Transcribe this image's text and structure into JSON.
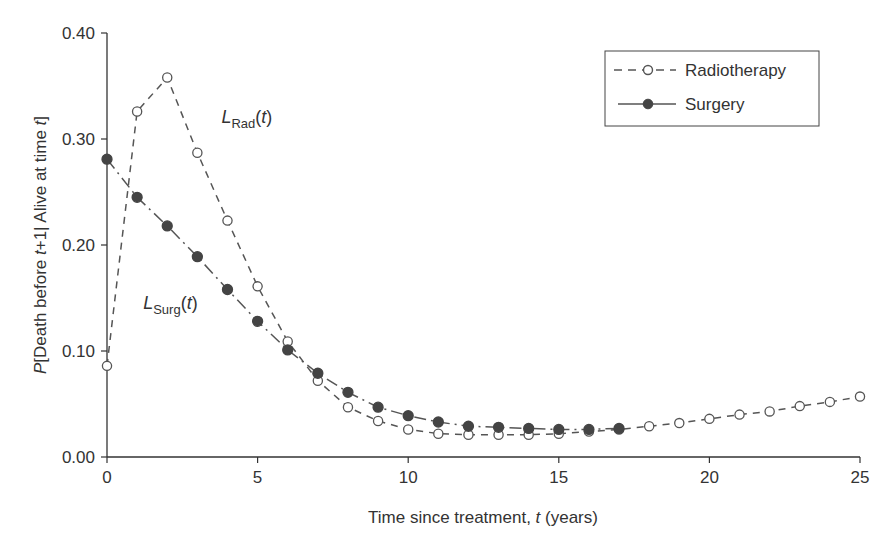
{
  "chart_data": {
    "type": "line",
    "title": "",
    "xlabel": "Time since treatment, t (years)",
    "ylabel": "P[Death before t+1 | Alive at time t]",
    "xlim": [
      0,
      25
    ],
    "ylim": [
      0,
      0.4
    ],
    "x_ticks": [
      "0",
      "5",
      "10",
      "15",
      "20",
      "25"
    ],
    "y_ticks": [
      "0.00",
      "0.10",
      "0.20",
      "0.30",
      "0.40"
    ],
    "grid": false,
    "legend_position": "upper right",
    "x": [
      0,
      1,
      2,
      3,
      4,
      5,
      6,
      7,
      8,
      9,
      10,
      11,
      12,
      13,
      14,
      15,
      16,
      17,
      18,
      19,
      20,
      21,
      22,
      23,
      24,
      25
    ],
    "series": [
      {
        "name": "Radiotherapy",
        "style": "dashed, open circle markers",
        "x": [
          0,
          1,
          2,
          3,
          4,
          5,
          6,
          7,
          8,
          9,
          10,
          11,
          12,
          13,
          14,
          15,
          16,
          17,
          18,
          19,
          20,
          21,
          22,
          23,
          24,
          25
        ],
        "values": [
          0.086,
          0.326,
          0.358,
          0.287,
          0.223,
          0.161,
          0.109,
          0.072,
          0.047,
          0.034,
          0.026,
          0.022,
          0.021,
          0.021,
          0.021,
          0.022,
          0.024,
          0.026,
          0.029,
          0.032,
          0.036,
          0.04,
          0.043,
          0.048,
          0.052,
          0.057
        ]
      },
      {
        "name": "Surgery",
        "style": "dash-dot, filled circle markers",
        "x": [
          0,
          1,
          2,
          3,
          4,
          5,
          6,
          7,
          8,
          9,
          10,
          11,
          12,
          13,
          14,
          15,
          16,
          17
        ],
        "values": [
          0.281,
          0.245,
          0.218,
          0.189,
          0.158,
          0.128,
          0.101,
          0.079,
          0.061,
          0.047,
          0.039,
          0.033,
          0.029,
          0.028,
          0.027,
          0.026,
          0.026,
          0.027
        ]
      }
    ],
    "annotations": [
      {
        "main": "L",
        "sub": "Rad",
        "tail": "(t)",
        "x": 3.8,
        "y": 0.315
      },
      {
        "main": "L",
        "sub": "Surg",
        "tail": "(t)",
        "x": 1.2,
        "y": 0.14
      }
    ]
  },
  "legend": {
    "items": [
      {
        "label": "Radiotherapy"
      },
      {
        "label": "Surgery"
      }
    ]
  },
  "axes": {
    "x_title_pre": "Time since treatment, ",
    "x_title_var": "t",
    "x_title_post": " (years)",
    "y_title_p": "P",
    "y_title_a": "[Death before ",
    "y_title_t1": "t",
    "y_title_b": "+1| Alive at time ",
    "y_title_t2": "t",
    "y_title_c": "]"
  },
  "colors": {
    "line": "#555555",
    "marker_fill_surgery": "#444444",
    "marker_fill_radio": "#ffffff",
    "axis": "#333333"
  }
}
